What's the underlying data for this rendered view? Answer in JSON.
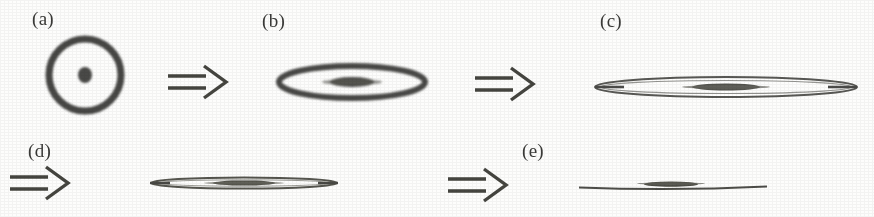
{
  "figure": {
    "kind": "deformation-sequence",
    "background_color": "#fdfdfc",
    "ink_color": "#3a3a38",
    "width": 874,
    "height": 217,
    "caption_labels": [
      "(a)",
      "(b)",
      "(c)",
      "(d)",
      "(e)"
    ]
  },
  "panels": [
    {
      "id": "a",
      "label": "(a)",
      "label_x": 32,
      "label_y": 8,
      "shape": "circle-with-core",
      "center_x": 85,
      "center_y": 75,
      "outer_rx": 38,
      "outer_ry": 38,
      "ring_thickness": 7,
      "core_rx": 7,
      "core_ry": 8,
      "aspect_ratio": "1.00"
    },
    {
      "id": "b",
      "label": "(b)",
      "label_x": 262,
      "label_y": 10,
      "shape": "ellipse-with-core",
      "center_x": 351,
      "center_y": 82,
      "outer_rx": 76,
      "outer_ry": 19,
      "ring_thickness": 6,
      "core_rx": 22,
      "core_ry": 5,
      "aspect_ratio": "4.00"
    },
    {
      "id": "c",
      "label": "(c)",
      "label_x": 600,
      "label_y": 10,
      "shape": "ellipse-with-core",
      "center_x": 725,
      "center_y": 87,
      "outer_rx": 130,
      "outer_ry": 11,
      "ring_thickness": 2,
      "core_rx": 35,
      "core_ry": 3,
      "aspect_ratio": "11.80"
    },
    {
      "id": "d",
      "label": "(d)",
      "label_x": 28,
      "label_y": 140,
      "shape": "ellipse-with-core",
      "center_x": 243,
      "center_y": 183,
      "outer_rx": 93,
      "outer_ry": 6,
      "ring_thickness": 1.8,
      "core_rx": 32,
      "core_ry": 2.5,
      "aspect_ratio": "15.50"
    },
    {
      "id": "e",
      "label": "(e)",
      "label_x": 522,
      "label_y": 140,
      "shape": "flat-line-with-core",
      "center_x": 672,
      "center_y": 186,
      "outer_rx": 93,
      "outer_ry": 2.5,
      "ring_thickness": 1.6,
      "core_rx": 27,
      "core_ry": 2.5,
      "aspect_ratio": "37.00"
    }
  ],
  "arrows": [
    {
      "id": "arrow-a-b",
      "from": "a",
      "to": "b",
      "x": 166,
      "y": 62,
      "width": 66,
      "height": 40,
      "glyph": "double-line-right-arrow"
    },
    {
      "id": "arrow-b-c",
      "from": "b",
      "to": "c",
      "x": 473,
      "y": 64,
      "width": 66,
      "height": 40,
      "glyph": "double-line-right-arrow"
    },
    {
      "id": "arrow-c-d",
      "from": "c",
      "to": "d",
      "x": 8,
      "y": 163,
      "width": 66,
      "height": 40,
      "glyph": "double-line-right-arrow"
    },
    {
      "id": "arrow-d-e",
      "from": "d",
      "to": "e",
      "x": 446,
      "y": 165,
      "width": 66,
      "height": 40,
      "glyph": "double-line-right-arrow"
    }
  ]
}
